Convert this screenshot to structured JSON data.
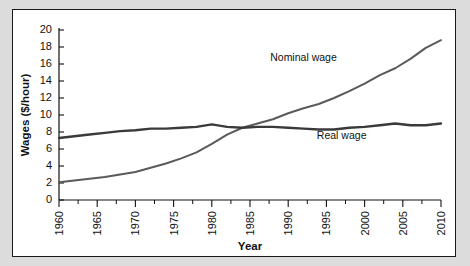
{
  "figure": {
    "background_color": "#dcdcdc",
    "panel_color": "#ffffff",
    "border_color": "#1a1a1a"
  },
  "chart_data": {
    "type": "line",
    "title": "",
    "xlabel": "Year",
    "ylabel": "Wages ($/hour)",
    "xlim": [
      1960,
      2010
    ],
    "ylim": [
      0,
      20
    ],
    "ytick_step": 2,
    "xtick_step": 5,
    "x_minor_tick_step": 2.5,
    "grid": false,
    "legend_position": "inline-annotations",
    "xticks": [
      1960,
      1965,
      1970,
      1975,
      1980,
      1985,
      1990,
      1995,
      2000,
      2005,
      2010
    ],
    "yticks": [
      0,
      2,
      4,
      6,
      8,
      10,
      12,
      14,
      16,
      18,
      20
    ],
    "x": [
      1960,
      1962,
      1964,
      1966,
      1968,
      1970,
      1972,
      1974,
      1976,
      1978,
      1980,
      1982,
      1984,
      1986,
      1988,
      1990,
      1992,
      1994,
      1996,
      1998,
      2000,
      2002,
      2004,
      2006,
      2008,
      2010
    ],
    "series": [
      {
        "name": "Nominal wage",
        "color": "#5a5a5a",
        "label": "Nominal wage",
        "label_x": 1992,
        "label_y": 16.3,
        "values": [
          2.1,
          2.3,
          2.5,
          2.7,
          3.0,
          3.3,
          3.8,
          4.3,
          4.9,
          5.6,
          6.6,
          7.7,
          8.5,
          9.0,
          9.5,
          10.2,
          10.8,
          11.3,
          12.0,
          12.8,
          13.7,
          14.7,
          15.5,
          16.6,
          17.9,
          18.8
        ]
      },
      {
        "name": "Real wage",
        "color": "#3a3a3a",
        "label": "Real wage",
        "label_x": 1997,
        "label_y": 7.2,
        "values": [
          7.3,
          7.5,
          7.7,
          7.9,
          8.1,
          8.2,
          8.4,
          8.4,
          8.5,
          8.6,
          8.9,
          8.6,
          8.5,
          8.6,
          8.6,
          8.5,
          8.4,
          8.3,
          8.3,
          8.5,
          8.6,
          8.8,
          9.0,
          8.8,
          8.8,
          9.0
        ]
      }
    ]
  }
}
